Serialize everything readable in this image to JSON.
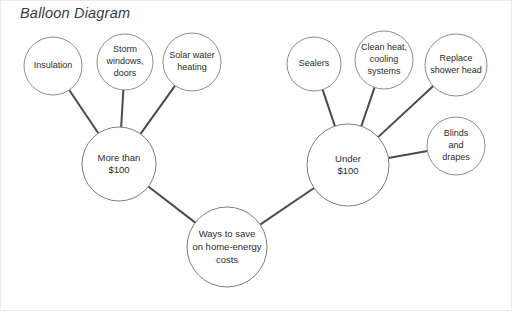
{
  "title": "Balloon Diagram",
  "diagram": {
    "type": "balloon-diagram",
    "center": {
      "id": "center",
      "label": "Ways to save on home-energy costs",
      "lines": [
        "Ways to save",
        "on home-energy",
        "costs"
      ],
      "cx": 227,
      "cy": 247,
      "r": 40,
      "font_size": 9.5
    },
    "hubs": [
      {
        "id": "hub-more-than-100",
        "label": "More than $100",
        "lines": [
          "More than",
          "$100"
        ],
        "cx": 119,
        "cy": 164,
        "r": 37,
        "font_size": 9.5
      },
      {
        "id": "hub-under-100",
        "label": "Under $100",
        "lines": [
          "Under",
          "$100"
        ],
        "cx": 348,
        "cy": 165,
        "r": 41,
        "font_size": 9.5
      }
    ],
    "leaves": [
      {
        "id": "leaf-insulation",
        "label": "Insulation",
        "lines": [
          "Insulation"
        ],
        "cx": 53,
        "cy": 66,
        "r": 29,
        "font_size": 9,
        "parent": "hub-more-than-100"
      },
      {
        "id": "leaf-storm-windows-doors",
        "label": "Storm windows, doors",
        "lines": [
          "Storm",
          "windows,",
          "doors"
        ],
        "cx": 125,
        "cy": 62,
        "r": 28,
        "font_size": 9,
        "parent": "hub-more-than-100"
      },
      {
        "id": "leaf-solar-water-heating",
        "label": "Solar water heating",
        "lines": [
          "Solar water",
          "heating"
        ],
        "cx": 192,
        "cy": 62,
        "r": 29,
        "font_size": 9,
        "parent": "hub-more-than-100"
      },
      {
        "id": "leaf-sealers",
        "label": "Sealers",
        "lines": [
          "Sealers"
        ],
        "cx": 314,
        "cy": 64,
        "r": 27,
        "font_size": 9,
        "parent": "hub-under-100"
      },
      {
        "id": "leaf-clean-heat-cooling-systems",
        "label": "Clean heat, cooling systems",
        "lines": [
          "Clean heat,",
          "cooling",
          "systems"
        ],
        "cx": 384,
        "cy": 60,
        "r": 29,
        "font_size": 9,
        "parent": "hub-under-100"
      },
      {
        "id": "leaf-replace-shower-head",
        "label": "Replace shower head",
        "lines": [
          "Replace",
          "shower head"
        ],
        "cx": 456,
        "cy": 65,
        "r": 31,
        "font_size": 9,
        "parent": "hub-under-100"
      },
      {
        "id": "leaf-blinds-and-drapes",
        "label": "Blinds and drapes",
        "lines": [
          "Blinds",
          "and",
          "drapes"
        ],
        "cx": 456,
        "cy": 146,
        "r": 29,
        "font_size": 9,
        "parent": "hub-under-100"
      }
    ],
    "connections": [
      {
        "from": "hub-more-than-100",
        "to": "center"
      },
      {
        "from": "hub-under-100",
        "to": "center"
      },
      {
        "from": "leaf-insulation",
        "to": "hub-more-than-100"
      },
      {
        "from": "leaf-storm-windows-doors",
        "to": "hub-more-than-100"
      },
      {
        "from": "leaf-solar-water-heating",
        "to": "hub-more-than-100"
      },
      {
        "from": "leaf-sealers",
        "to": "hub-under-100"
      },
      {
        "from": "leaf-clean-heat-cooling-systems",
        "to": "hub-under-100"
      },
      {
        "from": "leaf-replace-shower-head",
        "to": "hub-under-100"
      },
      {
        "from": "leaf-blinds-and-drapes",
        "to": "hub-under-100"
      }
    ],
    "colors": {
      "circle_stroke": "#8c8c8c",
      "connector_stroke": "#4a4a4a",
      "text": "#2c2c2c",
      "background": "#ffffff",
      "frame": "#e9e9e9"
    }
  }
}
